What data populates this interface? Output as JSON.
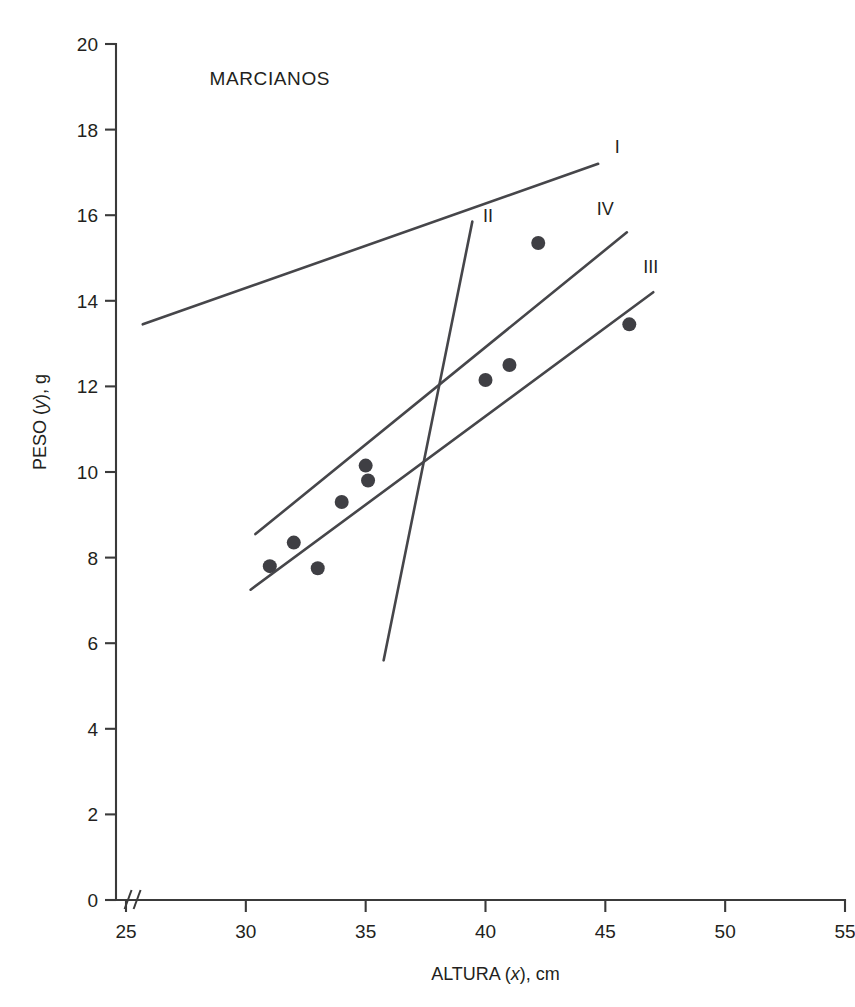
{
  "chart_data": {
    "type": "scatter",
    "title": "MARCIANOS",
    "xlabel": "ALTURA (x), cm",
    "ylabel": "PESO (y), g",
    "xlabel_parts": {
      "name": "ALTURA",
      "symbol": "x",
      "unit": "cm"
    },
    "ylabel_parts": {
      "name": "PESO",
      "symbol": "y",
      "unit": "g"
    },
    "xlim": [
      25,
      55
    ],
    "ylim": [
      0,
      20
    ],
    "xticks": [
      25,
      30,
      35,
      40,
      45,
      50,
      55
    ],
    "yticks": [
      0,
      2,
      4,
      6,
      8,
      10,
      12,
      14,
      16,
      18,
      20
    ],
    "xtick_labels": [
      "25",
      "30",
      "35",
      "40",
      "45",
      "50",
      "55"
    ],
    "ytick_labels": [
      "0",
      "2",
      "4",
      "6",
      "8",
      "10",
      "12",
      "14",
      "16",
      "18",
      "20"
    ],
    "grid": false,
    "legend": "none",
    "axis_break": {
      "axis": "x",
      "symbol": "//",
      "at": 25.4
    },
    "points": [
      {
        "x": 31.0,
        "y": 7.8
      },
      {
        "x": 32.0,
        "y": 8.35
      },
      {
        "x": 33.0,
        "y": 7.75
      },
      {
        "x": 34.0,
        "y": 9.3
      },
      {
        "x": 35.0,
        "y": 10.15
      },
      {
        "x": 35.1,
        "y": 9.8
      },
      {
        "x": 40.0,
        "y": 12.15
      },
      {
        "x": 41.0,
        "y": 12.5
      },
      {
        "x": 42.2,
        "y": 15.35
      },
      {
        "x": 46.0,
        "y": 13.45
      }
    ],
    "series": [
      {
        "name": "I",
        "label": "I",
        "x": [
          25.7,
          44.7
        ],
        "y": [
          13.45,
          17.2
        ]
      },
      {
        "name": "II",
        "label": "II",
        "x": [
          35.75,
          39.45
        ],
        "y": [
          5.6,
          15.85
        ]
      },
      {
        "name": "III",
        "label": "III",
        "x": [
          30.2,
          47.0
        ],
        "y": [
          7.25,
          14.2
        ]
      },
      {
        "name": "IV",
        "label": "IV",
        "x": [
          30.4,
          45.9
        ],
        "y": [
          8.55,
          15.6
        ]
      }
    ],
    "series_label_positions": [
      {
        "label": "I",
        "x": 45.5,
        "y": 17.45
      },
      {
        "label": "II",
        "x": 40.1,
        "y": 15.85
      },
      {
        "label": "III",
        "x": 46.9,
        "y": 14.65
      },
      {
        "label": "IV",
        "x": 45.0,
        "y": 16.0
      }
    ],
    "title_position": {
      "x": 31.0,
      "y": 19.05
    }
  },
  "colors": {
    "background": "#ffffff",
    "axis": "#3a3a3a",
    "line": "#46464a",
    "point": "#3f3f44",
    "text": "#231f20"
  }
}
